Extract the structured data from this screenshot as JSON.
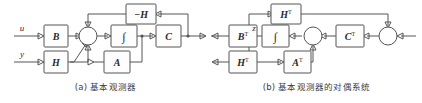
{
  "figure": {
    "kind": "control-block-diagram-pair",
    "background_color": "#ffffff",
    "line_color": "#555555",
    "text_color": "#2b2b2b"
  },
  "panel_a": {
    "caption": "(a) 基本观测器",
    "inputs": [
      {
        "name": "input-u",
        "label": "u"
      },
      {
        "name": "input-y",
        "label": "y"
      }
    ],
    "blocks": [
      {
        "name": "block-minus-h",
        "label": "−H",
        "sup": ""
      },
      {
        "name": "block-b",
        "label": "B",
        "sup": ""
      },
      {
        "name": "block-h",
        "label": "H",
        "sup": ""
      },
      {
        "name": "block-integrator",
        "label": "∫",
        "sup": ""
      },
      {
        "name": "block-c",
        "label": "C",
        "sup": ""
      },
      {
        "name": "block-a",
        "label": "A",
        "sup": ""
      }
    ],
    "summing_junctions": [
      {
        "name": "sum-junction-main"
      }
    ]
  },
  "panel_b": {
    "caption": "(b) 基本观测器的对偶系统",
    "signals": [
      {
        "name": "signal-z",
        "label": "z"
      }
    ],
    "blocks": [
      {
        "name": "block-h-transpose-top",
        "label": "H",
        "sup": "T"
      },
      {
        "name": "block-b-transpose",
        "label": "B",
        "sup": "T"
      },
      {
        "name": "block-integrator",
        "label": "∫",
        "sup": ""
      },
      {
        "name": "block-c-transpose",
        "label": "C",
        "sup": "T"
      },
      {
        "name": "block-h-transpose-bottom",
        "label": "H",
        "sup": "T"
      },
      {
        "name": "block-a-transpose",
        "label": "A",
        "sup": "T"
      }
    ],
    "summing_junctions": [
      {
        "name": "sum-junction-left"
      },
      {
        "name": "sum-junction-right"
      }
    ]
  }
}
